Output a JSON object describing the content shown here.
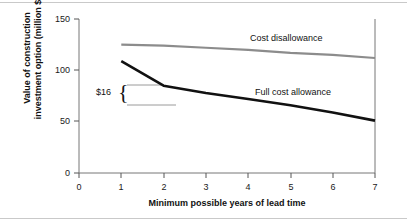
{
  "chart_data": {
    "type": "line",
    "title": "",
    "xlabel": "Minimum possible years of lead time",
    "ylabel": "Value of construction investment option (million $)",
    "ylabel_line1": "Value of construction",
    "ylabel_line2": "investment option (million $)",
    "xlim": [
      0,
      7
    ],
    "ylim": [
      0,
      150
    ],
    "xticks": [
      0,
      1,
      2,
      3,
      4,
      5,
      6,
      7
    ],
    "yticks": [
      0,
      50,
      100,
      150
    ],
    "xtick_labels": [
      "0",
      "1",
      "2",
      "3",
      "4",
      "5",
      "6",
      "7"
    ],
    "ytick_labels": [
      "0",
      "50",
      "100",
      "150"
    ],
    "grid": false,
    "legend_position": "inline-labels",
    "series": [
      {
        "name": "Cost disallowance",
        "color": "#8c8c8c",
        "x": [
          1,
          2,
          3,
          4,
          5,
          6,
          7
        ],
        "values": [
          125,
          124,
          122,
          120,
          117,
          115,
          112
        ]
      },
      {
        "name": "Full cost allowance",
        "color": "#111111",
        "x": [
          1,
          2,
          3,
          4,
          5,
          6,
          7
        ],
        "values": [
          109,
          85,
          78,
          72,
          66,
          59,
          51
        ]
      }
    ],
    "annotations": [
      {
        "name": "gap-bracket",
        "text": "$16",
        "brace": "{",
        "x": 1.0,
        "y_top": 85,
        "y_bottom": 66
      }
    ]
  },
  "figure": {
    "border_color": "#c9c9c9",
    "background": "#ffffff",
    "axis_color": "#555555"
  }
}
